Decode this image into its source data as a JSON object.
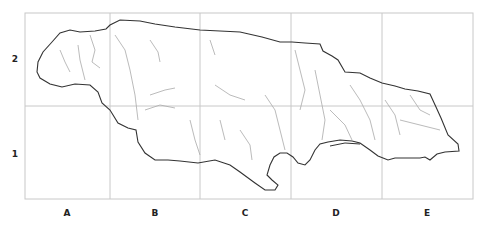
{
  "map": {
    "type": "grid-reference map",
    "grid": {
      "columns": [
        "A",
        "B",
        "C",
        "D",
        "E"
      ],
      "rows": [
        "2",
        "1"
      ]
    },
    "colors": {
      "coastline": "#333333",
      "rivers": "#aaaaaa",
      "grid": "#c8c8c8"
    }
  }
}
